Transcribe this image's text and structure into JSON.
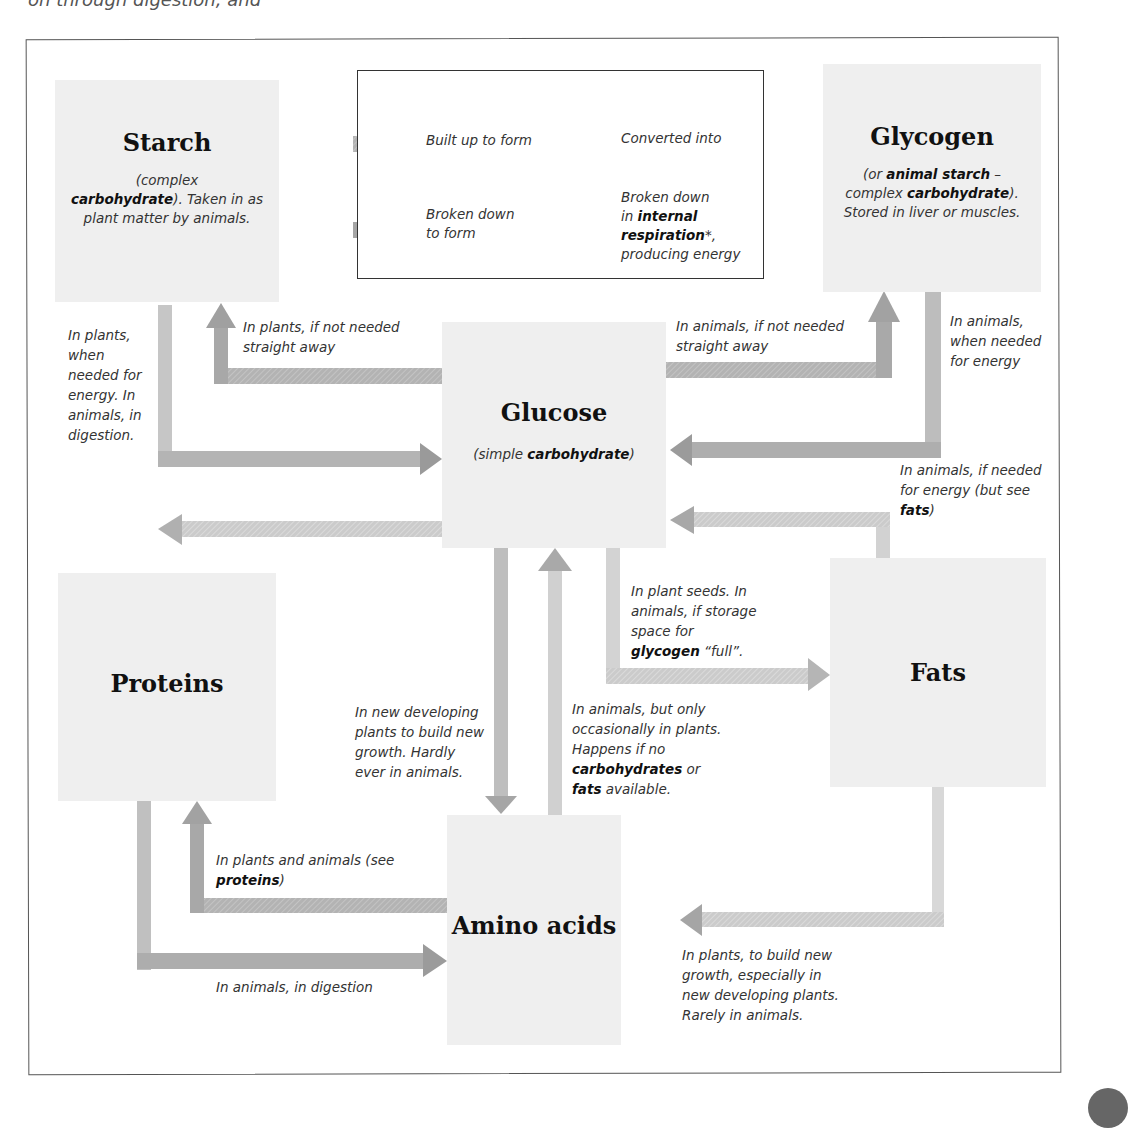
{
  "top_fragment": "on through digestion, and",
  "colors": {
    "node_bg": "#efefef",
    "arrow_built_up": "#a9a9a9",
    "arrow_converted": "#c9c9c9",
    "arrow_broken_down": "#9c9c9c",
    "arrow_respiration": "#bdbdbd",
    "frame": "#555555"
  },
  "legend": {
    "items": [
      {
        "icon": "built-up-arrow",
        "label": "Built up to form"
      },
      {
        "icon": "converted-arrow",
        "label": "Converted into"
      },
      {
        "icon": "broken-down-arrow",
        "label_line1": "Broken down",
        "label_line2": "to form"
      },
      {
        "icon": "respiration-arrow",
        "label_line1": "Broken down",
        "label_pre": "in ",
        "label_bold": "internal respiration",
        "label_post": "*,",
        "label_line4": "producing energy"
      }
    ]
  },
  "nodes": {
    "starch": {
      "title": "Starch",
      "sub_pre": "(complex ",
      "sub_bold": "carbohydrate",
      "sub_post": "). Taken in as plant matter by animals."
    },
    "glycogen": {
      "title": "Glycogen",
      "sub_pre": "(or ",
      "sub_bold1": "animal starch",
      "sub_mid": " – complex ",
      "sub_bold2": "carbohydrate",
      "sub_post": "). Stored in liver or muscles."
    },
    "glucose": {
      "title": "Glucose",
      "sub_pre": "(simple ",
      "sub_bold": "carbohydrate",
      "sub_post": ")"
    },
    "proteins": {
      "title": "Proteins"
    },
    "fats": {
      "title": "Fats"
    },
    "amino_acids": {
      "title": "Amino acids"
    }
  },
  "labels": {
    "starch_to_glucose": "In plants, when needed for energy. In animals, in digestion.",
    "glucose_to_starch": "In plants, if not needed straight away",
    "glucose_to_glycogen": "In animals, if not needed straight away",
    "glycogen_to_glucose": "In animals, when needed for energy",
    "fats_to_glucose_pre": "In animals, if needed for energy (but see ",
    "fats_to_glucose_bold": "fats",
    "fats_to_glucose_post": ")",
    "glucose_to_fats_pre": "In plant seeds. In animals, if storage space for ",
    "glucose_to_fats_bold": "glycogen",
    "glucose_to_fats_post": " “full”.",
    "glucose_to_amino": "In new developing plants to build new growth. Hardly ever in animals.",
    "amino_to_glucose_pre": "In animals, but only occasionally in plants. Happens if no ",
    "amino_to_glucose_bold1": "carbohydrates",
    "amino_to_glucose_mid": " or ",
    "amino_to_glucose_bold2": "fats",
    "amino_to_glucose_post": " available.",
    "amino_to_proteins_pre": "In plants and animals (see ",
    "amino_to_proteins_bold": "proteins",
    "amino_to_proteins_post": ")",
    "proteins_to_amino": "In animals, in digestion",
    "fats_to_amino": "In plants, to build new growth, especially in new developing plants. Rarely in animals."
  }
}
